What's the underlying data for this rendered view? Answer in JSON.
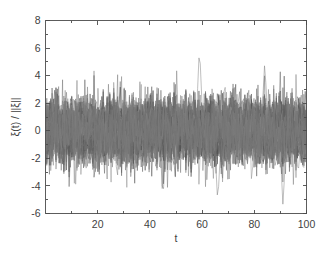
{
  "chart_data": {
    "type": "line",
    "title": "",
    "subtitle": "",
    "xlabel": "t",
    "ylabel": "ξ(t) / ||ξ||",
    "xlim": [
      0,
      100
    ],
    "ylim": [
      -6,
      8
    ],
    "x_ticks": [
      20,
      40,
      60,
      80,
      100
    ],
    "x_tick_labels": [
      "20",
      "40",
      "60",
      "80",
      "100"
    ],
    "x_minor_ticks": [
      10,
      30,
      50,
      70,
      90
    ],
    "y_ticks": [
      -6,
      -4,
      -2,
      0,
      2,
      4,
      6,
      8
    ],
    "y_tick_labels": [
      "-6",
      "-4",
      "-2",
      "0",
      "2",
      "4",
      "6",
      "8"
    ],
    "grid": false,
    "legend": null,
    "legend_position": "none",
    "box": true,
    "tick_direction": "in",
    "n_series": 50,
    "n_points_per_series": 200,
    "series_description": "Overlaid ensemble of normalized noise realizations",
    "line_color": "#5a5a5a",
    "line_width": 0.5,
    "value_range_typical": [
      -3.2,
      3.4
    ],
    "max_observed": 6.2,
    "max_observed_t": 59,
    "min_observed": -5.5,
    "min_observed_t": 91,
    "notable_peaks": [
      {
        "t": 59,
        "value": 6.2
      },
      {
        "t": 66,
        "value": -5.3
      },
      {
        "t": 91,
        "value": -5.5
      },
      {
        "t": 45,
        "value": -5.0
      },
      {
        "t": 84,
        "value": 5.0
      }
    ],
    "annotations": []
  },
  "figure": {
    "background_color": "#ffffff",
    "axes_color": "#4a4a4a",
    "text_color": "#3f3f3f"
  }
}
